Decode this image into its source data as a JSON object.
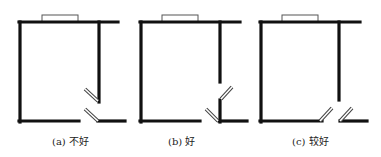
{
  "figure": {
    "panels": [
      {
        "id": "a",
        "caption": "(a) 不好",
        "caption_x": 52,
        "walls": [
          [
            19,
            22,
            118,
            22
          ],
          [
            20,
            22,
            20,
            122
          ],
          [
            19,
            121,
            79,
            121
          ],
          [
            99,
            22,
            99,
            102
          ],
          [
            98,
            121,
            125,
            121
          ]
        ],
        "window": [
          42,
          15,
          36,
          7
        ],
        "doors": [
          [
            85,
            89,
            98,
            101
          ],
          [
            85,
            109,
            98,
            121
          ]
        ]
      },
      {
        "id": "b",
        "caption": "(b) 好",
        "caption_x": 168,
        "walls": [
          [
            140,
            22,
            240,
            22
          ],
          [
            141,
            22,
            141,
            122
          ],
          [
            140,
            121,
            200,
            121
          ],
          [
            220,
            22,
            220,
            82
          ],
          [
            220,
            100,
            220,
            122
          ],
          [
            219,
            121,
            247,
            121
          ]
        ],
        "window": [
          162,
          15,
          36,
          7
        ],
        "doors": [
          [
            221,
            99,
            232,
            87
          ],
          [
            206,
            109,
            218,
            121
          ]
        ]
      },
      {
        "id": "c",
        "caption": "(c) 较好",
        "caption_x": 292,
        "walls": [
          [
            260,
            22,
            360,
            22
          ],
          [
            261,
            22,
            261,
            122
          ],
          [
            260,
            121,
            322,
            121
          ],
          [
            339,
            22,
            339,
            100
          ],
          [
            340,
            121,
            367,
            121
          ]
        ],
        "window": [
          282,
          15,
          36,
          7
        ],
        "doors": [
          [
            320,
            121,
            332,
            108
          ],
          [
            340,
            121,
            352,
            108
          ]
        ]
      }
    ],
    "colors": {
      "wall": "#111111",
      "window_stroke": "#555555",
      "door_stroke": "#444444",
      "background": "#ffffff"
    }
  }
}
